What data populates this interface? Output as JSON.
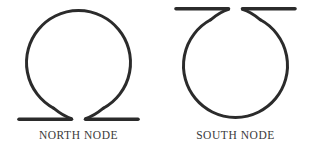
{
  "canvas": {
    "width": 314,
    "height": 157,
    "background_color": "#ffffff",
    "stroke_color": "#2b2b2b",
    "label_color": "#3a3a3a",
    "stroke_width": 3
  },
  "symbols": [
    {
      "id": "north-node",
      "label": "NORTH NODE",
      "glyph_name": "north-node-omega-glyph",
      "unicode": "☊",
      "orientation": "feet-at-bottom",
      "circle": {
        "cx": 78.5,
        "cy": 60,
        "r": 52
      },
      "gap_degrees": 62,
      "foot_bars": [
        {
          "x1": 18,
          "x2": 72,
          "y": 119
        },
        {
          "x1": 85,
          "x2": 139,
          "y": 119
        }
      ]
    },
    {
      "id": "south-node",
      "label": "SOUTH NODE",
      "glyph_name": "south-node-inverted-omega-glyph",
      "unicode": "☋",
      "orientation": "bars-at-top",
      "circle": {
        "cx": 78.5,
        "cy": 68,
        "r": 52
      },
      "gap_degrees": 62,
      "foot_bars": [
        {
          "x1": 18,
          "x2": 72,
          "y": 9
        },
        {
          "x1": 85,
          "x2": 139,
          "y": 9
        }
      ]
    }
  ]
}
